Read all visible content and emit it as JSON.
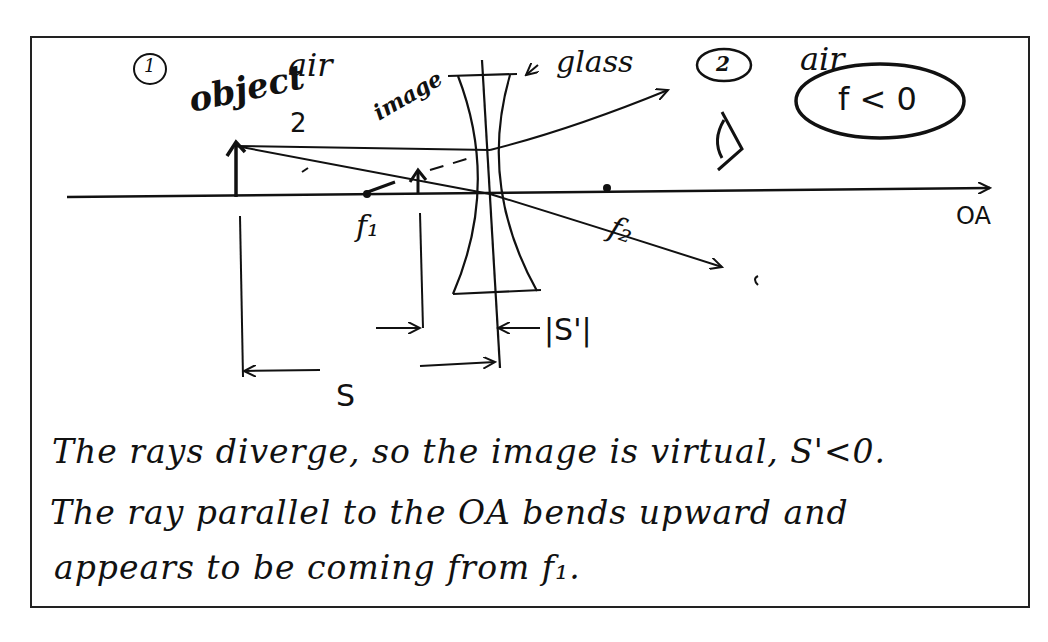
{
  "diagram": {
    "type": "ray-diagram",
    "region_labels": {
      "region1_number": "1",
      "region1_medium": "air",
      "region2_number": "2",
      "region2_medium": "air",
      "lens_material": "glass"
    },
    "labels": {
      "object": "object",
      "image": "image",
      "ray_label": "2",
      "focal_point_1": "f₁",
      "focal_point_2": "f₂",
      "optical_axis": "OA",
      "object_distance": "S",
      "image_distance": "|S'|",
      "focal_condition": "f < 0"
    },
    "notes": [
      "The rays diverge, so the image is virtual, S'<0.",
      "The ray parallel to the OA bends upward and",
      "appears to be coming from f₁."
    ],
    "colors": {
      "ink": "#111111",
      "paper": "#ffffff",
      "border": "#222222"
    }
  }
}
